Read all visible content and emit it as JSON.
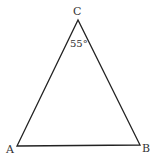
{
  "figure": {
    "type": "triangle",
    "stroke_color": "#222222",
    "vertices": {
      "A": {
        "label": "A",
        "x": 17,
        "y": 146
      },
      "B": {
        "label": "B",
        "x": 140,
        "y": 145
      },
      "C": {
        "label": "C",
        "x": 78,
        "y": 20
      }
    },
    "angle_annotation": {
      "vertex": "C",
      "text": "55°"
    }
  }
}
